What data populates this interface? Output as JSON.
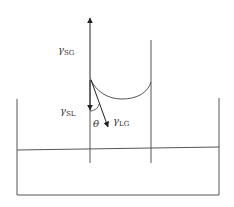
{
  "diagram": {
    "labels": {
      "gamma_sg": {
        "symbol": "γ",
        "subscript": "SG"
      },
      "gamma_sl": {
        "symbol": "γ",
        "subscript": "SL"
      },
      "gamma_lg": {
        "symbol": "γ",
        "subscript": "LG"
      },
      "theta": "θ"
    },
    "colors": {
      "line": "#555555",
      "arrow": "#222222",
      "text": "#333333"
    }
  }
}
